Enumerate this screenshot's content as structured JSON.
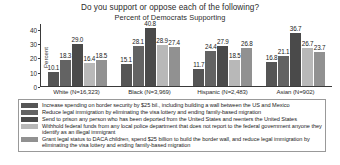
{
  "chart_data": {
    "type": "bar",
    "title": "Do you support or oppose each of the following?",
    "subtitle": "Percent of Democrats Supporting",
    "xlabel": "",
    "ylabel": "Percent",
    "ylim": [
      0,
      44
    ],
    "yticks": [
      0,
      10,
      20,
      30,
      40
    ],
    "grid": false,
    "legend_position": "bottom",
    "categories": [
      "White (N=16,323)",
      "Black (N=3,969)",
      "Hispanic (N=2,483)",
      "Asian (N=902)"
    ],
    "series": [
      {
        "name": "Increase spending on border security by $25 bil., including building a wall between the US and Mexico",
        "color": "#555555",
        "values": [
          10.1,
          15.1,
          11.7,
          16.8
        ]
      },
      {
        "name": "Reduce legal immigration by eliminating the visa lottery and ending family-based migration",
        "color": "#636363",
        "values": [
          18.3,
          28.1,
          24.4,
          21.1
        ]
      },
      {
        "name": "Send to prison any person who has been deported from the United States and reenters the United States",
        "color": "#4a4a4a",
        "values": [
          29.0,
          40.8,
          27.9,
          36.7
        ]
      },
      {
        "name": "Withhold federal funds from any local police department that does not report to the federal government anyone they identify as an illegal immigrant",
        "color": "#b8b8b8",
        "values": [
          16.4,
          28.9,
          18.5,
          26.7
        ]
      },
      {
        "name": "Grant legal status to DACA children, spend $25 billion to build the border wall, and reduce legal immigration by eliminating the visa lottery and ending family-based migration",
        "color": "#919191",
        "values": [
          18.5,
          27.4,
          26.8,
          23.7
        ]
      }
    ],
    "bar_labels": [
      [
        "10.1",
        "18.3",
        "29.0",
        "16.4",
        "18.5"
      ],
      [
        "15.1",
        "28.1",
        "40.8",
        "28.9",
        "27.4"
      ],
      [
        "11.7",
        "24.4",
        "27.9",
        "18.5",
        "26.8"
      ],
      [
        "16.8",
        "21.1",
        "36.7",
        "26.7",
        "23.7"
      ]
    ]
  }
}
